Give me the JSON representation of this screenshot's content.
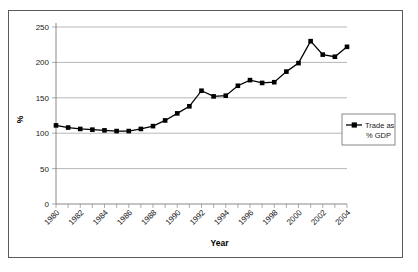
{
  "chart_data": {
    "type": "line",
    "title": "",
    "xlabel": "Year",
    "ylabel": "%",
    "xlim": [
      1980,
      2004
    ],
    "ylim": [
      0,
      250
    ],
    "ytick_step": 50,
    "xtick_label_step": 2,
    "grid": true,
    "legend_position": "right",
    "marker": "square",
    "series_color": "#000000",
    "x": [
      1980,
      1981,
      1982,
      1983,
      1984,
      1985,
      1986,
      1987,
      1988,
      1989,
      1990,
      1991,
      1992,
      1993,
      1994,
      1995,
      1996,
      1997,
      1998,
      1999,
      2000,
      2001,
      2002,
      2003,
      2004
    ],
    "series": [
      {
        "name": "Trade as % GDP",
        "values": [
          111,
          108,
          106,
          105,
          104,
          103,
          103,
          106,
          110,
          118,
          128,
          138,
          160,
          152,
          153,
          167,
          175,
          171,
          172,
          187,
          199,
          230,
          211,
          208,
          222
        ]
      }
    ],
    "ytick_labels": [
      "0",
      "50",
      "100",
      "150",
      "200",
      "250"
    ],
    "xtick_labels": [
      "1980",
      "1982",
      "1984",
      "1986",
      "1988",
      "1990",
      "1992",
      "1994",
      "1996",
      "1998",
      "2000",
      "2002",
      "2004"
    ]
  },
  "legend": {
    "entries": [
      {
        "line1": "Trade as",
        "line2": "% GDP"
      }
    ]
  }
}
